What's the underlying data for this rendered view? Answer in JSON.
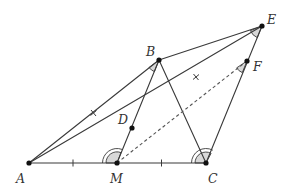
{
  "diagram": {
    "type": "geometry",
    "points": {
      "A": {
        "label": "A",
        "x": 29,
        "y": 163
      },
      "M": {
        "label": "M",
        "x": 117,
        "y": 163
      },
      "C": {
        "label": "C",
        "x": 206,
        "y": 163
      },
      "B": {
        "label": "B",
        "x": 159,
        "y": 60
      },
      "D": {
        "label": "D",
        "x": 132,
        "y": 128
      },
      "E": {
        "label": "E",
        "x": 262,
        "y": 26
      },
      "F": {
        "label": "F",
        "x": 247,
        "y": 61
      }
    },
    "segments": [
      {
        "from": "A",
        "to": "C",
        "style": "solid"
      },
      {
        "from": "A",
        "to": "B",
        "style": "solid",
        "mark": "x-tick"
      },
      {
        "from": "A",
        "to": "E",
        "style": "solid",
        "through": "D",
        "mark": "x-tick on DE"
      },
      {
        "from": "M",
        "to": "B",
        "style": "solid",
        "through": "D"
      },
      {
        "from": "B",
        "to": "C",
        "style": "solid"
      },
      {
        "from": "B",
        "to": "E",
        "style": "solid"
      },
      {
        "from": "C",
        "to": "E",
        "style": "solid",
        "through": "F"
      },
      {
        "from": "M",
        "to": "F",
        "style": "dashed"
      }
    ],
    "equal_marks": {
      "AM_MC": "single tick",
      "AB_DE": "x tick"
    },
    "angle_marks": [
      {
        "vertex": "B",
        "style": "single filled arc"
      },
      {
        "vertex": "E",
        "style": "single filled arc"
      },
      {
        "vertex": "F",
        "style": "single filled arc"
      },
      {
        "vertex": "M",
        "style": "double filled arc"
      },
      {
        "vertex": "C",
        "style": "double filled arc"
      }
    ]
  }
}
